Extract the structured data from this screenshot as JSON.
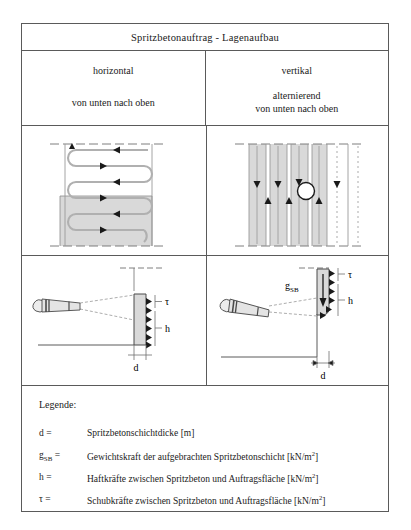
{
  "header": {
    "title": "Spritzbetonauftrag - Lagenaufbau"
  },
  "columns": {
    "left": {
      "mode": "horizontal",
      "direction": "von unten nach oben"
    },
    "right": {
      "mode": "vertikal",
      "direction_line1": "alternierend",
      "direction_line2": "von unten nach oben"
    }
  },
  "diagrams": {
    "left": {
      "label_tau": "τ",
      "label_h": "h",
      "label_d": "d"
    },
    "right": {
      "label_gsb_base": "g",
      "label_gsb_sub": "SB",
      "label_tau": "τ",
      "label_h": "h",
      "label_d": "d"
    }
  },
  "legend": {
    "title": "Legende:",
    "rows": [
      {
        "sym": "d =",
        "text": "Spritzbetonschichtdicke [m]"
      },
      {
        "sym_base": "g",
        "sym_sub": "SB",
        "sym_eq": " =",
        "text_a": "Gewichtskraft der aufgebrachten Spritzbetonschicht [kN/m",
        "text_b": "2",
        "text_c": "]"
      },
      {
        "sym": "h =",
        "text_a": "Haftkräfte zwischen Spritzbeton und Auftragsfläche [kN/m",
        "text_b": "2",
        "text_c": "]"
      },
      {
        "sym": "τ =",
        "text_a": "Schubkräfte zwischen Spritzbeton und Auftragsfläche [kN/m",
        "text_b": "2",
        "text_c": "]"
      }
    ]
  },
  "colors": {
    "ink": "#1a1a1a",
    "rule": "#5a5a5a",
    "shade": "#d9d9d9",
    "line": "#808080",
    "paper": "#ffffff"
  }
}
